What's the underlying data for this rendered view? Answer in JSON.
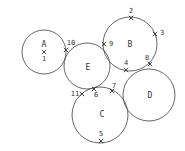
{
  "diagram": {
    "type": "circles-with-numbered-points",
    "background": "#ffffff",
    "stroke_color": "#555555",
    "text_color": "#333333",
    "circles": [
      {
        "id": "A",
        "label": "A",
        "cx": 44,
        "cy": 52,
        "r": 22,
        "label_x": 44,
        "label_y": 44
      },
      {
        "id": "B",
        "label": "B",
        "cx": 130,
        "cy": 44,
        "r": 27,
        "label_x": 130,
        "label_y": 44
      },
      {
        "id": "E",
        "label": "E",
        "cx": 87,
        "cy": 66,
        "r": 23,
        "label_x": 88,
        "label_y": 67
      },
      {
        "id": "C",
        "label": "C",
        "cx": 100,
        "cy": 115,
        "r": 28,
        "label_x": 102,
        "label_y": 114
      },
      {
        "id": "D",
        "label": "D",
        "cx": 149,
        "cy": 95,
        "r": 26,
        "label_x": 150,
        "label_y": 95
      }
    ],
    "points": [
      {
        "id": "1",
        "label": "1",
        "x": 44,
        "y": 52,
        "label_x": 44,
        "label_y": 59
      },
      {
        "id": "2",
        "label": "2",
        "x": 131,
        "y": 18,
        "label_x": 131,
        "label_y": 11
      },
      {
        "id": "3",
        "label": "3",
        "x": 155,
        "y": 34,
        "label_x": 162,
        "label_y": 33
      },
      {
        "id": "4",
        "label": "4",
        "x": 126,
        "y": 70,
        "label_x": 126,
        "label_y": 63
      },
      {
        "id": "5",
        "label": "5",
        "x": 101,
        "y": 141,
        "label_x": 101,
        "label_y": 134
      },
      {
        "id": "6",
        "label": "6",
        "x": 94,
        "y": 89,
        "label_x": 96,
        "label_y": 95
      },
      {
        "id": "7",
        "label": "7",
        "x": 112,
        "y": 91,
        "label_x": 114,
        "label_y": 86
      },
      {
        "id": "8",
        "label": "8",
        "x": 150,
        "y": 64,
        "label_x": 147,
        "label_y": 58
      },
      {
        "id": "9",
        "label": "9",
        "x": 104,
        "y": 44,
        "label_x": 111,
        "label_y": 44
      },
      {
        "id": "10",
        "label": "10",
        "x": 66,
        "y": 50,
        "label_x": 71,
        "label_y": 43
      },
      {
        "id": "11",
        "label": "11",
        "x": 82,
        "y": 94,
        "label_x": 75,
        "label_y": 94
      }
    ]
  }
}
